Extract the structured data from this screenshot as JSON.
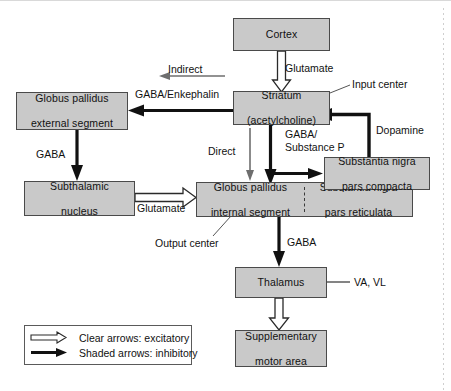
{
  "diagram": {
    "colors": {
      "node_fill": "#c9c9c9",
      "node_border": "#4a4a4a",
      "arrow_shaded": "#111111",
      "arrow_clear_outline": "#2a2a2a",
      "thin_arrow": "#6e6e6e",
      "text": "#111111",
      "page_background": "#ffffff"
    },
    "nodes": [
      {
        "id": "cortex",
        "line1": "Cortex",
        "line2": ""
      },
      {
        "id": "striatum",
        "line1": "Striatum",
        "line2": "(acetylcholine)"
      },
      {
        "id": "gpe",
        "line1": "Globus pallidus",
        "line2": "external segment"
      },
      {
        "id": "stn",
        "line1": "Subthalamic",
        "line2": "nucleus"
      },
      {
        "id": "gpi",
        "line1": "Globus pallidus",
        "line2": "internal segment"
      },
      {
        "id": "snr",
        "line1": "Substantia nigra",
        "line2": "pars reticulata"
      },
      {
        "id": "snc",
        "line1": "Substantia nigra",
        "line2": "pars compacta"
      },
      {
        "id": "thalamus",
        "line1": "Thalamus",
        "line2": ""
      },
      {
        "id": "sma",
        "line1": "Supplementary",
        "line2": "motor area"
      }
    ],
    "edge_labels": {
      "glutamate_cortex": "Glutamate",
      "gaba_enkephalin": "GABA/Enkephalin",
      "indirect": "Indirect",
      "direct": "Direct",
      "gaba_gpe": "GABA",
      "gaba_substance_p_1": "GABA/",
      "gaba_substance_p_2": "Substance P",
      "dopamine": "Dopamine",
      "glutamate_stn": "Glutamate",
      "gaba_gpi": "GABA",
      "va_vl": "VA, VL"
    },
    "annotations": {
      "input_center": "Input center",
      "output_center": "Output center"
    },
    "legend": {
      "rows": [
        {
          "glyph": "clear-arrow-icon",
          "text": "Clear arrows: excitatory"
        },
        {
          "glyph": "shaded-arrow-icon",
          "text": "Shaded arrows: inhibitory"
        }
      ]
    }
  }
}
